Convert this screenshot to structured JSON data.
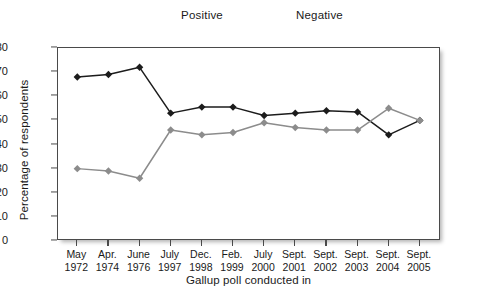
{
  "legend": {
    "position": "top-center",
    "items": [
      {
        "label": "Positive",
        "color": "#1c1c1c",
        "marker": "diamond"
      },
      {
        "label": "Negative",
        "color": "#8c8c8c",
        "marker": "diamond"
      }
    ]
  },
  "axes": {
    "ylabel": "Percentage of respondents",
    "xlabel": "Gallup poll conducted in",
    "yticks": [
      0,
      10,
      20,
      30,
      40,
      50,
      60,
      70,
      80
    ],
    "ylim": [
      0,
      80
    ]
  },
  "chart_data": {
    "type": "line",
    "title": "",
    "xlabel": "Gallup poll conducted in",
    "ylabel": "Percentage of respondents",
    "ylim": [
      0,
      80
    ],
    "yticks": [
      0,
      10,
      20,
      30,
      40,
      50,
      60,
      70,
      80
    ],
    "grid": false,
    "legend_position": "top-center",
    "categories": [
      "May 1972",
      "Apr. 1974",
      "June 1976",
      "July 1997",
      "Dec. 1998",
      "Feb. 1999",
      "July 2000",
      "Sept. 2001",
      "Sept. 2002",
      "Sept. 2003",
      "Sept. 2004",
      "Sept. 2005"
    ],
    "category_lines": [
      [
        "May",
        "1972"
      ],
      [
        "Apr.",
        "1974"
      ],
      [
        "June",
        "1976"
      ],
      [
        "July",
        "1997"
      ],
      [
        "Dec.",
        "1998"
      ],
      [
        "Feb.",
        "1999"
      ],
      [
        "July",
        "2000"
      ],
      [
        "Sept.",
        "2001"
      ],
      [
        "Sept.",
        "2002"
      ],
      [
        "Sept.",
        "2003"
      ],
      [
        "Sept.",
        "2004"
      ],
      [
        "Sept.",
        "2005"
      ]
    ],
    "series": [
      {
        "name": "Positive",
        "color": "#1c1c1c",
        "marker": "diamond",
        "values": [
          68,
          69,
          72,
          53,
          55.5,
          55.5,
          52,
          53,
          54,
          53.5,
          44,
          50
        ]
      },
      {
        "name": "Negative",
        "color": "#8c8c8c",
        "marker": "diamond",
        "values": [
          30,
          29,
          26,
          46,
          44,
          45,
          49,
          47,
          46,
          46,
          55,
          50
        ]
      }
    ]
  }
}
